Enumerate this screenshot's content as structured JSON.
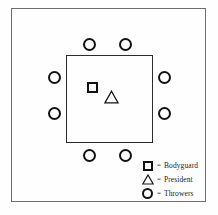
{
  "figure": {
    "name": "seating-diagram",
    "background_color": "#fefefe",
    "frame_color": "#6e6e6e",
    "ink_color": "#121212"
  },
  "table": {
    "name": "conference-table",
    "shape": "square"
  },
  "markers": {
    "bodyguard": {
      "icon": "square-marker",
      "count": 1
    },
    "president": {
      "icon": "triangle-marker",
      "count": 1
    },
    "throwers": {
      "icon": "circle-marker",
      "count": 8
    }
  },
  "throwers": [
    {
      "id": "thrower-top-left",
      "x": 83,
      "y": 38
    },
    {
      "id": "thrower-top-right",
      "x": 119,
      "y": 38
    },
    {
      "id": "thrower-left-upper",
      "x": 48,
      "y": 71
    },
    {
      "id": "thrower-left-lower",
      "x": 48,
      "y": 107
    },
    {
      "id": "thrower-right-upper",
      "x": 158,
      "y": 71
    },
    {
      "id": "thrower-right-lower",
      "x": 158,
      "y": 107
    },
    {
      "id": "thrower-bottom-left",
      "x": 83,
      "y": 149
    },
    {
      "id": "thrower-bottom-right",
      "x": 119,
      "y": 149
    }
  ],
  "legend": {
    "equals": "=",
    "items": [
      {
        "symbol": "square-marker",
        "label": "Bodyguard"
      },
      {
        "symbol": "triangle-marker",
        "label": "President"
      },
      {
        "symbol": "circle-marker",
        "label": "Throwers"
      }
    ]
  }
}
